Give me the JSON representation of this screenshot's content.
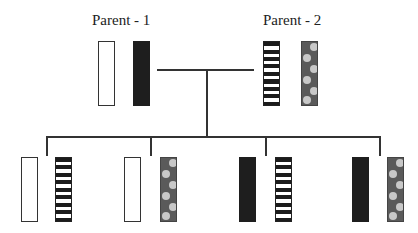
{
  "diagram": {
    "type": "inheritance-pedigree",
    "parents": [
      {
        "label": "Parent - 1",
        "chromosomes": [
          "white",
          "black"
        ]
      },
      {
        "label": "Parent - 2",
        "chromosomes": [
          "striped",
          "dotted"
        ]
      }
    ],
    "offspring": [
      {
        "chromosomes": [
          "white",
          "striped"
        ]
      },
      {
        "chromosomes": [
          "white",
          "dotted"
        ]
      },
      {
        "chromosomes": [
          "black",
          "striped"
        ]
      },
      {
        "chromosomes": [
          "black",
          "dotted"
        ]
      }
    ],
    "colors": {
      "line": "#333333",
      "white_fill": "#ffffff",
      "black_fill": "#1e1e1e",
      "stripe_dark": "#1b1b1b",
      "dot_background": "#5a5a5a",
      "dot_color": "#c8c8c8"
    }
  }
}
